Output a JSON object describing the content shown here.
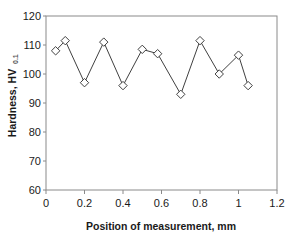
{
  "chart_data": {
    "type": "line",
    "title": "",
    "xlabel": "Position of measurement, mm",
    "ylabel": "Hardness, HV",
    "ylabel_subscript": "0.1",
    "xlim": [
      0,
      1.2
    ],
    "ylim": [
      60,
      120
    ],
    "xticks": [
      0,
      0.2,
      0.4,
      0.6,
      0.8,
      1,
      1.2
    ],
    "xtick_labels": [
      "0",
      "0.2",
      "0.4",
      "0.6",
      "0.8",
      "1",
      "1.2"
    ],
    "yticks": [
      60,
      70,
      80,
      90,
      100,
      110,
      120
    ],
    "ytick_labels": [
      "60",
      "70",
      "80",
      "90",
      "100",
      "110",
      "120"
    ],
    "grid": false,
    "legend": null,
    "marker": "open-diamond",
    "line_color": "#404040",
    "marker_edge_color": "#404040",
    "marker_face_color": "#ffffff",
    "frame": true,
    "x": [
      0.05,
      0.1,
      0.2,
      0.3,
      0.4,
      0.5,
      0.58,
      0.7,
      0.8,
      0.9,
      1.0,
      1.05
    ],
    "values": [
      108.0,
      111.5,
      97.0,
      111.0,
      96.0,
      108.5,
      107.0,
      93.0,
      111.5,
      100.0,
      106.5,
      96.0
    ]
  },
  "axes": {
    "x_title": "Position of measurement, mm",
    "y_title": "Hardness, HV",
    "y_title_subscript": "0.1"
  }
}
